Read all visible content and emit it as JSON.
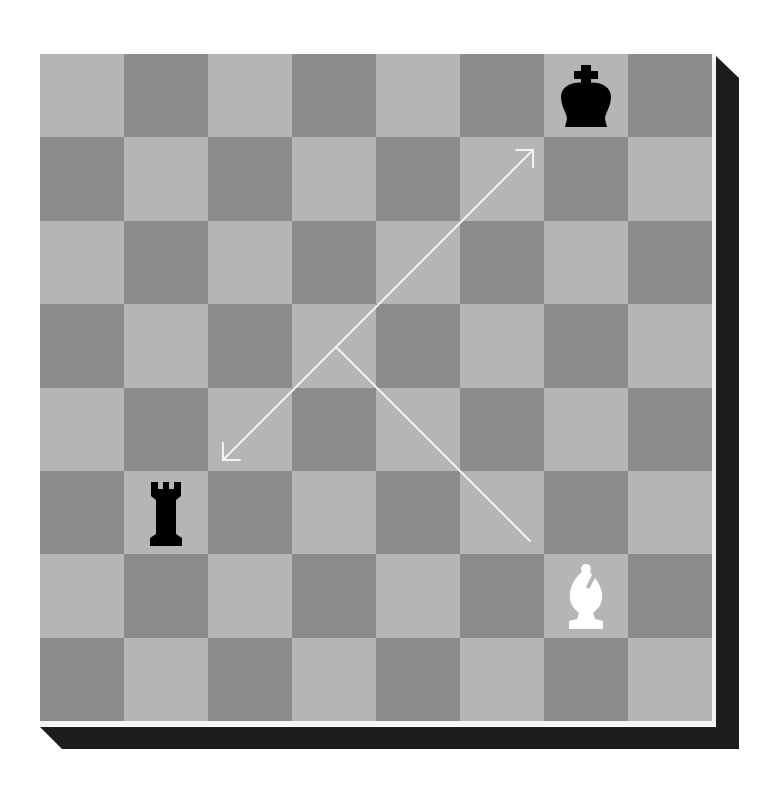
{
  "board": {
    "files": [
      "a",
      "b",
      "c",
      "d",
      "e",
      "f",
      "g",
      "h"
    ],
    "ranks": [
      8,
      7,
      6,
      5,
      4,
      3,
      2,
      1
    ],
    "colors": {
      "light": "#b5b5b5",
      "dark": "#8b8b8b",
      "shadow": "#1c1c1c",
      "border": "#f4f4f4",
      "arrow": "#f2f2f2"
    },
    "pieces": [
      {
        "square": "g8",
        "type": "king",
        "color": "black"
      },
      {
        "square": "b3",
        "type": "rook",
        "color": "black"
      },
      {
        "square": "g2",
        "type": "bishop",
        "color": "white"
      }
    ]
  },
  "annotations": {
    "arrows": [
      {
        "name": "diagonal-arrow-up-right",
        "from": "junction",
        "to": "f7"
      },
      {
        "name": "diagonal-arrow-down-left",
        "from": "junction",
        "to": "c4"
      }
    ],
    "lines": [
      {
        "name": "bishop-path-line",
        "from": "g3",
        "to": "d5"
      }
    ]
  }
}
